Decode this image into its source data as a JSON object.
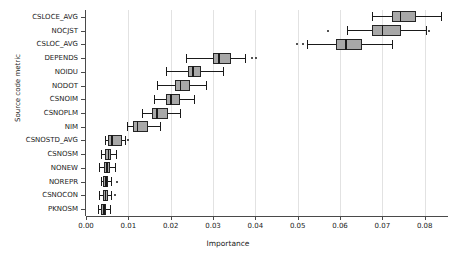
{
  "chart_data": {
    "type": "box",
    "title": "",
    "xlabel": "Importance",
    "ylabel": "Source code metric",
    "xlim": [
      0.0,
      0.0855
    ],
    "grid": true,
    "legend": null,
    "xticks": [
      0.0,
      0.01,
      0.02,
      0.03,
      0.04,
      0.05,
      0.06,
      0.07,
      0.08
    ],
    "xticklabels": [
      "0.00",
      "0.01",
      "0.02",
      "0.03",
      "0.04",
      "0.05",
      "0.06",
      "0.07",
      "0.08"
    ],
    "categories": [
      "CSLOCE_AVG",
      "NOCJST",
      "CSLOC_AVG",
      "DEPENDS",
      "NOIDU",
      "NODOT",
      "CSNOIM",
      "CSNOPLM",
      "NIM",
      "CSNOSTD_AVG",
      "CSNOSM",
      "NONEW",
      "NOREPR",
      "CSNOCON",
      "PKNOSM"
    ],
    "boxes": [
      {
        "category": "CSLOCE_AVG",
        "whisker_low": 0.0676,
        "q1": 0.0723,
        "median": 0.0741,
        "q3": 0.0779,
        "whisker_high": 0.0838,
        "outliers": []
      },
      {
        "category": "NOCJST",
        "whisker_low": 0.0617,
        "q1": 0.0675,
        "median": 0.0699,
        "q3": 0.0745,
        "whisker_high": 0.0803,
        "outliers": [
          0.057,
          0.0808
        ]
      },
      {
        "category": "CSLOC_AVG",
        "whisker_low": 0.0521,
        "q1": 0.0591,
        "median": 0.0612,
        "q3": 0.0652,
        "whisker_high": 0.0723,
        "outliers": [
          0.0495,
          0.051
        ]
      },
      {
        "category": "DEPENDS",
        "whisker_low": 0.0236,
        "q1": 0.0299,
        "median": 0.0312,
        "q3": 0.0342,
        "whisker_high": 0.0375,
        "outliers": [
          0.039,
          0.0398
        ]
      },
      {
        "category": "NOIDU",
        "whisker_low": 0.0189,
        "q1": 0.024,
        "median": 0.0251,
        "q3": 0.0271,
        "whisker_high": 0.0324,
        "outliers": []
      },
      {
        "category": "NODOT",
        "whisker_low": 0.0167,
        "q1": 0.0211,
        "median": 0.0222,
        "q3": 0.0245,
        "whisker_high": 0.0283,
        "outliers": []
      },
      {
        "category": "CSNOIM",
        "whisker_low": 0.016,
        "q1": 0.0188,
        "median": 0.0199,
        "q3": 0.0223,
        "whisker_high": 0.0256,
        "outliers": []
      },
      {
        "category": "CSNOPLM",
        "whisker_low": 0.0133,
        "q1": 0.0157,
        "median": 0.0166,
        "q3": 0.0194,
        "whisker_high": 0.0223,
        "outliers": []
      },
      {
        "category": "NIM",
        "whisker_low": 0.0096,
        "q1": 0.011,
        "median": 0.012,
        "q3": 0.0147,
        "whisker_high": 0.0174,
        "outliers": []
      },
      {
        "category": "CSNOSTD_AVG",
        "whisker_low": 0.0044,
        "q1": 0.0053,
        "median": 0.006,
        "q3": 0.0084,
        "whisker_high": 0.0093,
        "outliers": [
          0.0098
        ]
      },
      {
        "category": "CSNOSM",
        "whisker_low": 0.0035,
        "q1": 0.0044,
        "median": 0.0051,
        "q3": 0.006,
        "whisker_high": 0.007,
        "outliers": []
      },
      {
        "category": "NONEW",
        "whisker_low": 0.0031,
        "q1": 0.0042,
        "median": 0.0048,
        "q3": 0.0057,
        "whisker_high": 0.0068,
        "outliers": []
      },
      {
        "category": "NOREPR",
        "whisker_low": 0.0035,
        "q1": 0.0041,
        "median": 0.0046,
        "q3": 0.0053,
        "whisker_high": 0.006,
        "outliers": [
          0.007
        ]
      },
      {
        "category": "CSNOCON",
        "whisker_low": 0.0031,
        "q1": 0.0039,
        "median": 0.0044,
        "q3": 0.0051,
        "whisker_high": 0.0058,
        "outliers": [
          0.0065
        ]
      },
      {
        "category": "PKNOSM",
        "whisker_low": 0.0028,
        "q1": 0.0036,
        "median": 0.0041,
        "q3": 0.0048,
        "whisker_high": 0.0056,
        "outliers": []
      }
    ]
  }
}
